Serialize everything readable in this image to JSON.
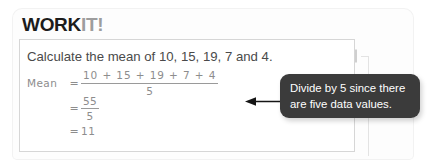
{
  "card": {
    "title": {
      "primary": "WORK",
      "accent": "IT!"
    }
  },
  "problem": {
    "question": "Calculate the mean of 10, 15, 19, 7 and 4.",
    "working": {
      "label": "Mean",
      "equals": "=",
      "line1": {
        "numerator": "10 + 15 + 19 + 7 + 4",
        "denominator": "5"
      },
      "line2": {
        "numerator": "55",
        "denominator": "5"
      },
      "line3": {
        "value": "11"
      }
    }
  },
  "callout": {
    "line1": "Divide by 5 since there",
    "line2": "are five data values."
  },
  "icons": {
    "pencil": "pencil-icon",
    "arrow": "arrow-left-icon"
  },
  "colors": {
    "title_primary": "#1c1c1c",
    "title_accent": "#9d9d9d",
    "callout_bg": "#3b3b3b",
    "callout_text": "#ffffff",
    "handwriting": "#8d8d8d",
    "panel_border": "#d6d6d6"
  }
}
